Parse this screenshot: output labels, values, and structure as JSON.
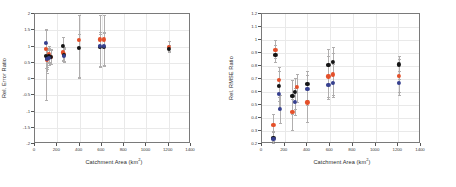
{
  "figure": {
    "panels": [
      "left",
      "right"
    ],
    "colors": {
      "red": "#e4502a",
      "black": "#141414",
      "blue": "#36408f",
      "errorbar": "#b0aeae",
      "grid": "#e9e9e9",
      "frame": "#7a7a7a"
    }
  },
  "chart_data": [
    {
      "type": "scatter",
      "title": "",
      "xlabel": "Catchment Area (km2)",
      "xlabel_base": "Catchment Area (km",
      "xlabel_sup": "2",
      "xlabel_tail": ")",
      "ylabel": "Rel. Error Ratio",
      "xlim": [
        0,
        1400
      ],
      "ylim": [
        -2,
        2
      ],
      "xticks": [
        0,
        200,
        400,
        600,
        800,
        1000,
        1200,
        1400
      ],
      "xticklabels": [
        "0",
        "200",
        "400",
        "600",
        "800",
        "1000",
        "1200",
        "1400"
      ],
      "yticks": [
        -2,
        -1.5,
        -1,
        -0.5,
        0,
        0.5,
        1,
        1.5,
        2
      ],
      "yticklabels": [
        "-2",
        "-1.5",
        "-1",
        "-0.5",
        "0",
        "0.5",
        "1",
        "1.5",
        "2"
      ],
      "grid": true,
      "legend": "none",
      "series": [
        {
          "name": "red",
          "color": "#e4502a",
          "points": [
            {
              "x": 95,
              "y": 0.93,
              "ylo": -0.66,
              "yhi": 1.55
            },
            {
              "x": 108,
              "y": 0.6,
              "ylo": 0.3,
              "yhi": 0.95
            },
            {
              "x": 126,
              "y": 0.78,
              "ylo": 0.52,
              "yhi": 1.02
            },
            {
              "x": 140,
              "y": 0.68,
              "ylo": 0.45,
              "yhi": 0.92
            },
            {
              "x": 250,
              "y": 0.82,
              "ylo": 0.55,
              "yhi": 1.3
            },
            {
              "x": 262,
              "y": 0.76,
              "ylo": 0.55,
              "yhi": 0.98
            },
            {
              "x": 395,
              "y": 1.2,
              "ylo": 0.02,
              "yhi": 1.98
            },
            {
              "x": 580,
              "y": 1.22,
              "ylo": 0.38,
              "yhi": 1.98
            },
            {
              "x": 620,
              "y": 1.22,
              "ylo": 0.4,
              "yhi": 1.98
            },
            {
              "x": 1205,
              "y": 1.0,
              "ylo": 0.86,
              "yhi": 1.18
            }
          ]
        },
        {
          "name": "black",
          "color": "#141414",
          "points": [
            {
              "x": 95,
              "y": 0.7,
              "ylo": 0.33,
              "yhi": 1.1
            },
            {
              "x": 108,
              "y": 0.66,
              "ylo": 0.38,
              "yhi": 0.96
            },
            {
              "x": 126,
              "y": 0.7,
              "ylo": 0.48,
              "yhi": 0.94
            },
            {
              "x": 140,
              "y": 0.68,
              "ylo": 0.46,
              "yhi": 0.9
            },
            {
              "x": 250,
              "y": 1.01,
              "ylo": 0.6,
              "yhi": 1.28
            },
            {
              "x": 262,
              "y": 0.74,
              "ylo": 0.55,
              "yhi": 0.95
            },
            {
              "x": 395,
              "y": 0.96,
              "ylo": 0.05,
              "yhi": 1.4
            },
            {
              "x": 580,
              "y": 0.98,
              "ylo": 0.38,
              "yhi": 1.4
            },
            {
              "x": 620,
              "y": 0.98,
              "ylo": 0.4,
              "yhi": 1.42
            },
            {
              "x": 1205,
              "y": 0.92,
              "ylo": 0.82,
              "yhi": 1.05
            }
          ]
        },
        {
          "name": "blue",
          "color": "#36408f",
          "points": [
            {
              "x": 95,
              "y": 1.1,
              "ylo": 0.6,
              "yhi": 1.52
            },
            {
              "x": 108,
              "y": 0.62,
              "ylo": 0.2,
              "yhi": 0.92
            },
            {
              "x": 126,
              "y": 0.64,
              "ylo": 0.42,
              "yhi": 0.88
            },
            {
              "x": 262,
              "y": 0.7,
              "ylo": 0.52,
              "yhi": 0.93
            },
            {
              "x": 580,
              "y": 1.02,
              "ylo": 0.4,
              "yhi": 1.44
            },
            {
              "x": 620,
              "y": 1.02,
              "ylo": 0.42,
              "yhi": 1.46
            }
          ]
        }
      ]
    },
    {
      "type": "scatter",
      "title": "",
      "xlabel": "Catchment Area (km2)",
      "xlabel_base": "Catchment Area (km",
      "xlabel_sup": "2",
      "xlabel_tail": ")",
      "ylabel": "Rel. RMSE Ratio",
      "xlim": [
        0,
        1400
      ],
      "ylim": [
        0.2,
        1.2
      ],
      "xticks": [
        0,
        200,
        400,
        600,
        800,
        1000,
        1200,
        1400
      ],
      "xticklabels": [
        "0",
        "200",
        "400",
        "600",
        "800",
        "1000",
        "1200",
        "1400"
      ],
      "yticks": [
        0.2,
        0.3,
        0.4,
        0.5,
        0.6,
        0.7,
        0.8,
        0.9,
        1.0,
        1.1,
        1.2
      ],
      "yticklabels": [
        "0.2",
        "0.3",
        "0.4",
        "0.5",
        "0.6",
        "0.7",
        "0.8",
        "0.9",
        "1",
        "1.1",
        "1.2"
      ],
      "grid": true,
      "legend": "none",
      "series": [
        {
          "name": "red",
          "color": "#e4502a",
          "points": [
            {
              "x": 100,
              "y": 0.345,
              "ylo": 0.225,
              "yhi": 0.43
            },
            {
              "x": 118,
              "y": 0.925,
              "ylo": 0.86,
              "yhi": 1.0
            },
            {
              "x": 148,
              "y": 0.695,
              "ylo": 0.56,
              "yhi": 0.79
            },
            {
              "x": 268,
              "y": 0.45,
              "ylo": 0.31,
              "yhi": 0.545
            },
            {
              "x": 305,
              "y": 0.64,
              "ylo": 0.52,
              "yhi": 0.74
            },
            {
              "x": 400,
              "y": 0.52,
              "ylo": 0.37,
              "yhi": 0.625
            },
            {
              "x": 585,
              "y": 0.72,
              "ylo": 0.56,
              "yhi": 0.88
            },
            {
              "x": 625,
              "y": 0.735,
              "ylo": 0.575,
              "yhi": 0.9
            },
            {
              "x": 1205,
              "y": 0.725,
              "ylo": 0.6,
              "yhi": 0.855
            }
          ]
        },
        {
          "name": "black",
          "color": "#141414",
          "points": [
            {
              "x": 100,
              "y": 0.248,
              "ylo": 0.205,
              "yhi": 0.3
            },
            {
              "x": 118,
              "y": 0.885,
              "ylo": 0.83,
              "yhi": 0.96
            },
            {
              "x": 148,
              "y": 0.648,
              "ylo": 0.53,
              "yhi": 0.76
            },
            {
              "x": 268,
              "y": 0.57,
              "ylo": 0.43,
              "yhi": 0.69
            },
            {
              "x": 290,
              "y": 0.598,
              "ylo": 0.47,
              "yhi": 0.705
            },
            {
              "x": 400,
              "y": 0.66,
              "ylo": 0.54,
              "yhi": 0.76
            },
            {
              "x": 585,
              "y": 0.81,
              "ylo": 0.66,
              "yhi": 0.93
            },
            {
              "x": 625,
              "y": 0.832,
              "ylo": 0.68,
              "yhi": 0.945
            },
            {
              "x": 1205,
              "y": 0.812,
              "ylo": 0.7,
              "yhi": 0.88
            }
          ]
        },
        {
          "name": "blue",
          "color": "#36408f",
          "points": [
            {
              "x": 100,
              "y": 0.24,
              "ylo": 0.205,
              "yhi": 0.29
            },
            {
              "x": 148,
              "y": 0.588,
              "ylo": 0.47,
              "yhi": 0.7
            },
            {
              "x": 160,
              "y": 0.468,
              "ylo": 0.36,
              "yhi": 0.58
            },
            {
              "x": 290,
              "y": 0.522,
              "ylo": 0.42,
              "yhi": 0.63
            },
            {
              "x": 400,
              "y": 0.622,
              "ylo": 0.5,
              "yhi": 0.73
            },
            {
              "x": 585,
              "y": 0.655,
              "ylo": 0.545,
              "yhi": 0.8
            },
            {
              "x": 625,
              "y": 0.672,
              "ylo": 0.56,
              "yhi": 0.815
            },
            {
              "x": 1205,
              "y": 0.672,
              "ylo": 0.58,
              "yhi": 0.76
            }
          ]
        }
      ]
    }
  ]
}
